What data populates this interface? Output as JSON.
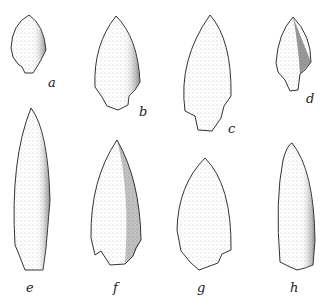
{
  "figure": {
    "specimens": [
      {
        "label": "a",
        "x": 50,
        "y": 74
      },
      {
        "label": "b",
        "x": 140,
        "y": 107
      },
      {
        "label": "c",
        "x": 230,
        "y": 124
      },
      {
        "label": "d",
        "x": 307,
        "y": 94
      },
      {
        "label": "e",
        "x": 27,
        "y": 282
      },
      {
        "label": "f",
        "x": 113,
        "y": 282
      },
      {
        "label": "g",
        "x": 198,
        "y": 282
      },
      {
        "label": "h",
        "x": 291,
        "y": 282
      }
    ]
  }
}
